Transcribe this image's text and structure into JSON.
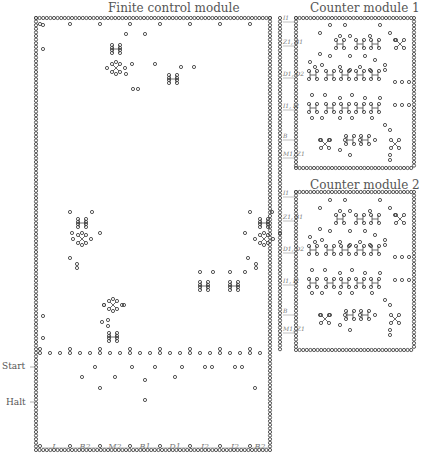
{
  "modules": {
    "finite_control": {
      "title": "Finite control module",
      "box": [
        36,
        18,
        270,
        450
      ]
    },
    "counter1": {
      "title": "Counter module 1",
      "box": [
        296,
        18,
        414,
        168
      ]
    },
    "counter2": {
      "title": "Counter module 2",
      "box": [
        296,
        192,
        414,
        350
      ]
    }
  },
  "side_labels": {
    "start": "Start",
    "halt": "Halt"
  },
  "bottom_labels": [
    "L",
    "B2",
    "M2",
    "B1",
    "D1",
    "I2",
    "I2",
    "B2"
  ],
  "port_labels": [
    "I1",
    "Z1, B1",
    "D1, D2",
    "I1, I2",
    "B",
    "M1, Z1"
  ],
  "colors": {
    "dot": "#444444",
    "text": "#555555",
    "arrow": "#999999"
  },
  "gadgets": [
    {
      "type": "cross",
      "x": 116,
      "y": 49
    },
    {
      "type": "star",
      "x": 116,
      "y": 68
    },
    {
      "type": "cross",
      "x": 173,
      "y": 79
    },
    {
      "type": "cross",
      "x": 82,
      "y": 223
    },
    {
      "type": "star",
      "x": 82,
      "y": 239
    },
    {
      "type": "cross",
      "x": 264,
      "y": 223
    },
    {
      "type": "star",
      "x": 264,
      "y": 239
    },
    {
      "type": "cross",
      "x": 204,
      "y": 286
    },
    {
      "type": "cross",
      "x": 234,
      "y": 286
    },
    {
      "type": "star",
      "x": 113,
      "y": 305
    },
    {
      "type": "cross",
      "x": 113,
      "y": 337
    }
  ]
}
